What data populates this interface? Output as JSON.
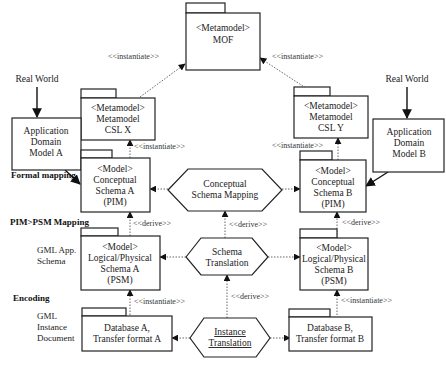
{
  "diagram": {
    "packages": {
      "mof": {
        "stereotype": "<Metamodel>",
        "name": "MOF"
      },
      "csl_x": {
        "stereotype": "<Metamodel>",
        "lines": [
          "Metamodel",
          "CSL X"
        ]
      },
      "csl_y": {
        "stereotype": "<Metamodel>",
        "lines": [
          "Metamodel",
          "CSL Y"
        ]
      },
      "conceptual_a": {
        "stereotype": "<Model>",
        "lines": [
          "Conceptual",
          "Schema A",
          "(PIM)"
        ]
      },
      "conceptual_b": {
        "stereotype": "<Model>",
        "lines": [
          "Conceptual",
          "Schema B",
          "(PIM)"
        ]
      },
      "logical_a": {
        "stereotype": "<Model>",
        "lines": [
          "Logical/Physical",
          "Schema A",
          "(PSM)"
        ]
      },
      "logical_b": {
        "stereotype": "<Model>",
        "lines": [
          "Logical/Physical",
          "Schema B",
          "(PSM)"
        ]
      },
      "database_a": {
        "lines": [
          "Database A,",
          "Transfer format A"
        ]
      },
      "database_b": {
        "lines": [
          "Database B,",
          "Transfer format B"
        ]
      }
    },
    "domain_models": {
      "a": {
        "lines": [
          "Application",
          "Domain",
          "Model A"
        ]
      },
      "b": {
        "lines": [
          "Application",
          "Domain",
          "Model B"
        ]
      }
    },
    "real_world_a": "Real World",
    "real_world_b": "Real World",
    "processes": {
      "conceptual_mapping": {
        "lines": [
          "Conceptual",
          "Schema Mapping"
        ]
      },
      "schema_translation": {
        "lines": [
          "Schema",
          "Translation"
        ]
      },
      "instance_translation": {
        "lines": [
          "Instance",
          "Translation"
        ]
      }
    },
    "stereotypes": {
      "instantiate": "<<instantiate>>",
      "derive": "<<derive>>"
    },
    "side_labels": {
      "formal_mapping": "Formal mapping",
      "pim_psm": "PIM>PSM Mapping",
      "gml_app_schema": [
        "GML App.",
        "Schema"
      ],
      "encoding": "Encoding",
      "gml_instance": [
        "GML",
        "Instance",
        "Document"
      ]
    }
  }
}
